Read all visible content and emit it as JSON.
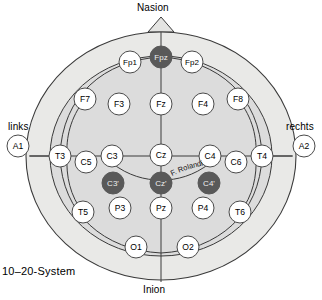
{
  "figure": {
    "caption": "10–20-System",
    "anatomy_labels": {
      "nasion": "Nasion",
      "inion": "Inion",
      "left": "links",
      "right": "rechts"
    },
    "annotations": [
      {
        "name": "fissura-rolandi",
        "text": "F. Rolandi"
      }
    ]
  },
  "colors": {
    "head_fill": "#e8e8e6",
    "scalp_fill": "#dedede",
    "outline": "#3a3a3a",
    "electrode_fill": "#ffffff",
    "electrode_stroke": "#4a4a4a",
    "electrode_highlight_fill": "#595959",
    "electrode_highlight_text": "#f0f0f0",
    "text": "#000000",
    "background": "#ffffff"
  },
  "electrodes": [
    {
      "id": "A1",
      "label": "A1",
      "x": 18,
      "y": 146,
      "r": 11,
      "highlight": false,
      "group": "reference"
    },
    {
      "id": "A2",
      "label": "A2",
      "x": 304,
      "y": 146,
      "r": 11,
      "highlight": false,
      "group": "reference"
    },
    {
      "id": "Fp1",
      "label": "Fp1",
      "x": 130,
      "y": 62,
      "r": 11,
      "highlight": false,
      "group": "frontopolar"
    },
    {
      "id": "Fpz",
      "label": "Fpz",
      "x": 161,
      "y": 57,
      "r": 11,
      "highlight": true,
      "group": "frontopolar"
    },
    {
      "id": "Fp2",
      "label": "Fp2",
      "x": 192,
      "y": 62,
      "r": 11,
      "highlight": false,
      "group": "frontopolar"
    },
    {
      "id": "F7",
      "label": "F7",
      "x": 85,
      "y": 99,
      "r": 11,
      "highlight": false,
      "group": "frontal"
    },
    {
      "id": "F3",
      "label": "F3",
      "x": 119,
      "y": 104,
      "r": 11,
      "highlight": false,
      "group": "frontal"
    },
    {
      "id": "Fz",
      "label": "Fz",
      "x": 161,
      "y": 104,
      "r": 11,
      "highlight": false,
      "group": "frontal"
    },
    {
      "id": "F4",
      "label": "F4",
      "x": 203,
      "y": 104,
      "r": 11,
      "highlight": false,
      "group": "frontal"
    },
    {
      "id": "F8",
      "label": "F8",
      "x": 238,
      "y": 99,
      "r": 11,
      "highlight": false,
      "group": "frontal"
    },
    {
      "id": "T3",
      "label": "T3",
      "x": 60,
      "y": 156,
      "r": 11,
      "highlight": false,
      "group": "temporal"
    },
    {
      "id": "C5",
      "label": "C5",
      "x": 86,
      "y": 162,
      "r": 11,
      "highlight": false,
      "group": "central"
    },
    {
      "id": "C3",
      "label": "C3",
      "x": 112,
      "y": 156,
      "r": 11,
      "highlight": false,
      "group": "central"
    },
    {
      "id": "Cz",
      "label": "Cz",
      "x": 161,
      "y": 155,
      "r": 11,
      "highlight": false,
      "group": "central"
    },
    {
      "id": "C4",
      "label": "C4",
      "x": 210,
      "y": 156,
      "r": 11,
      "highlight": false,
      "group": "central"
    },
    {
      "id": "C6",
      "label": "C6",
      "x": 236,
      "y": 162,
      "r": 11,
      "highlight": false,
      "group": "central"
    },
    {
      "id": "T4",
      "label": "T4",
      "x": 262,
      "y": 156,
      "r": 11,
      "highlight": false,
      "group": "temporal"
    },
    {
      "id": "C3p",
      "label": "C3'",
      "x": 113,
      "y": 183,
      "r": 11,
      "highlight": true,
      "group": "central-prime"
    },
    {
      "id": "Czp",
      "label": "Cz'",
      "x": 161,
      "y": 183,
      "r": 11,
      "highlight": true,
      "group": "central-prime"
    },
    {
      "id": "C4p",
      "label": "C4'",
      "x": 209,
      "y": 183,
      "r": 11,
      "highlight": true,
      "group": "central-prime"
    },
    {
      "id": "T5",
      "label": "T5",
      "x": 83,
      "y": 212,
      "r": 11,
      "highlight": false,
      "group": "temporal"
    },
    {
      "id": "P3",
      "label": "P3",
      "x": 120,
      "y": 208,
      "r": 11,
      "highlight": false,
      "group": "parietal"
    },
    {
      "id": "Pz",
      "label": "Pz",
      "x": 161,
      "y": 208,
      "r": 11,
      "highlight": false,
      "group": "parietal"
    },
    {
      "id": "P4",
      "label": "P4",
      "x": 203,
      "y": 208,
      "r": 11,
      "highlight": false,
      "group": "parietal"
    },
    {
      "id": "T6",
      "label": "T6",
      "x": 240,
      "y": 212,
      "r": 11,
      "highlight": false,
      "group": "temporal"
    },
    {
      "id": "O1",
      "label": "O1",
      "x": 136,
      "y": 247,
      "r": 11,
      "highlight": false,
      "group": "occipital"
    },
    {
      "id": "O2",
      "label": "O2",
      "x": 188,
      "y": 247,
      "r": 11,
      "highlight": false,
      "group": "occipital"
    }
  ]
}
